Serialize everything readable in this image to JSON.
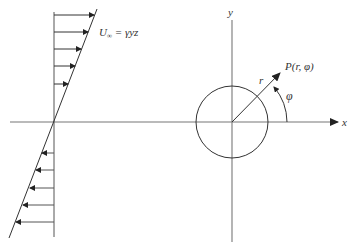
{
  "diagram": {
    "shear_flow": {
      "label": "U∞ = γyz",
      "label_main": "U",
      "label_sub": "∞",
      "label_rest": " = γyz",
      "arrows_right_y": [
        15,
        32,
        49,
        66,
        84
      ],
      "arrows_left_y": [
        153,
        170,
        188,
        205,
        222
      ]
    },
    "axes": {
      "x_label": "x",
      "y_label": "y"
    },
    "point": {
      "label": "P(r, φ)",
      "radius_label": "r",
      "angle_label": "φ"
    },
    "colors": {
      "line": "#333333",
      "axis": "#666666"
    }
  }
}
